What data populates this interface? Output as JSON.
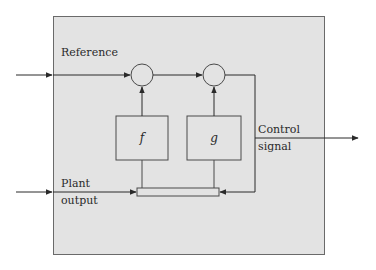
{
  "diagram": {
    "container": {
      "fill": "#e3e3e3",
      "stroke": "#6a6a6a"
    },
    "labels": {
      "reference": "Reference",
      "plant_output_line1": "Plant",
      "plant_output_line2": "output",
      "control_signal_line1": "Control",
      "control_signal_line2": "signal"
    },
    "blocks": [
      {
        "id": "f",
        "label": "f"
      },
      {
        "id": "g",
        "label": "g"
      }
    ],
    "summing_junctions": 2,
    "connections": [
      "Reference -> junction1",
      "junction1 -> junction2",
      "f -> junction1",
      "g -> junction2",
      "junction2 -> Control signal",
      "Control signal -> bar (feedback)",
      "Plant output -> bar",
      "bar -> f",
      "bar -> g"
    ]
  }
}
